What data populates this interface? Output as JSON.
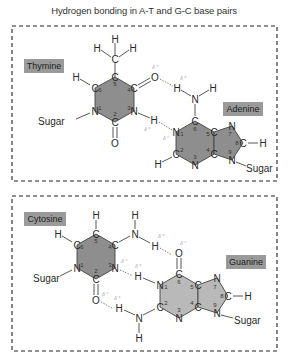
{
  "title": "Hydrogen bonding in A-T and G-C base pairs",
  "colors": {
    "ring_fill": "#8e8e8e",
    "ring_fill_light": "#b9b9b9",
    "label_bg": "#9a9a9a",
    "delta": "#a8a8a8",
    "box_border": "#222222"
  },
  "panels": [
    {
      "name": "A-T pair",
      "bases": [
        {
          "label": "Thymine",
          "atoms": [
            "C",
            "C",
            "C",
            "N",
            "C",
            "N"
          ],
          "numbers": [
            "6",
            "5",
            "4",
            "3",
            "2",
            "1"
          ],
          "substituents": [
            "H",
            "CH3",
            "O",
            "H",
            "O",
            "Sugar"
          ]
        },
        {
          "label": "Adenine",
          "atoms": [
            "C",
            "N",
            "C",
            "N",
            "C",
            "C",
            "N",
            "C",
            "N"
          ],
          "numbers": [
            "6",
            "1",
            "2",
            "3",
            "4",
            "5",
            "7",
            "8",
            "9"
          ],
          "substituents": [
            "NH2",
            "H",
            "H",
            "Sugar"
          ]
        }
      ],
      "hydrogen_bonds": 2
    },
    {
      "name": "G-C pair",
      "bases": [
        {
          "label": "Cytosine",
          "atoms": [
            "C",
            "C",
            "C",
            "N",
            "C",
            "N"
          ],
          "numbers": [
            "6",
            "5",
            "4",
            "3",
            "2",
            "1"
          ],
          "substituents": [
            "H",
            "H",
            "NH2",
            "O",
            "Sugar"
          ]
        },
        {
          "label": "Guanine",
          "atoms": [
            "C",
            "N",
            "C",
            "N",
            "C",
            "C",
            "N",
            "C",
            "N"
          ],
          "numbers": [
            "6",
            "1",
            "2",
            "3",
            "4",
            "5",
            "7",
            "8",
            "9"
          ],
          "substituents": [
            "O",
            "H",
            "NH2",
            "H",
            "Sugar"
          ]
        }
      ],
      "hydrogen_bonds": 3
    }
  ],
  "labels": {
    "thymine": "Thymine",
    "adenine": "Adenine",
    "cytosine": "Cytosine",
    "guanine": "Guanine",
    "sugar": "Sugar",
    "delta_neg": "δ⁻",
    "delta_pos": "δ⁺"
  }
}
